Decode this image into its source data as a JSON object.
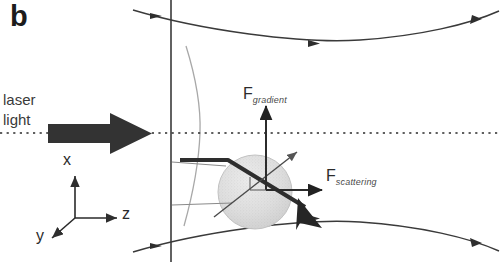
{
  "figure": {
    "panel_label": "b",
    "caption_topic": "optical-trap-ray-diagram"
  },
  "labels": {
    "laser_line1": "laser",
    "laser_line2": "light",
    "force_gradient_symbol": "F",
    "force_gradient_subscript": "gradient",
    "force_scattering_symbol": "F",
    "force_scattering_subscript": "scattering"
  },
  "axes": {
    "x_label": "x",
    "y_label": "y",
    "z_label": "z"
  },
  "colors": {
    "ink": "#1c1c1c",
    "line": "#3a3a3a",
    "thick_ray": "#2e2e2e",
    "thin_ray": "#6e6e6e",
    "bead_fill": "#dcdcdc",
    "bead_edge": "#c2c2c2",
    "background": "#ffffff",
    "arrow_block": "#333333"
  },
  "geometry": {
    "optical_axis_y": 133,
    "focal_plane_x": 171,
    "bead_center_x": 255,
    "bead_center_y": 192,
    "bead_radius": 37
  }
}
